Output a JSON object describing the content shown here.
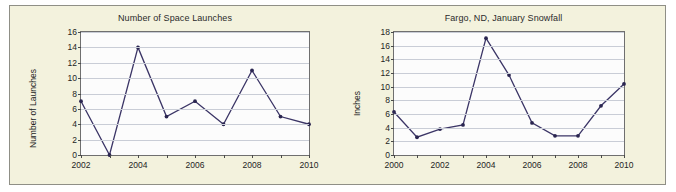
{
  "figure": {
    "background_color": "#f3f2dd",
    "border_color": "#8f8f86"
  },
  "style": {
    "line_color": "#3b3566",
    "marker_color": "#2a2550",
    "grid_color": "#c9cdd6",
    "plot_background": "#fcfcfc",
    "axis_color": "#6f6f6f"
  },
  "chart_data": [
    {
      "type": "line",
      "name": "space-launches",
      "title": "Number of Space Launches",
      "xlabel": "",
      "ylabel": "Number of Launches",
      "x": [
        2002,
        2003,
        2004,
        2005,
        2006,
        2007,
        2008,
        2009,
        2010
      ],
      "values": [
        7,
        0,
        14,
        5,
        7,
        4,
        11,
        5,
        4
      ],
      "xlim": [
        2002,
        2010
      ],
      "ylim": [
        0,
        16
      ],
      "yticks": [
        0,
        2,
        4,
        6,
        8,
        10,
        12,
        14,
        16
      ],
      "ytick_labels": [
        "0",
        "2",
        "4",
        "6",
        "8",
        "10",
        "12",
        "14",
        "16"
      ],
      "xticks": [
        2002,
        2003,
        2004,
        2005,
        2006,
        2007,
        2008,
        2009,
        2010
      ],
      "xtick_labels": [
        "2002",
        "",
        "2004",
        "",
        "2006",
        "",
        "2008",
        "",
        "2010"
      ],
      "grid": true,
      "legend": false
    },
    {
      "type": "line",
      "name": "fargo-snowfall",
      "title": "Fargo, ND, January Snowfall",
      "xlabel": "",
      "ylabel": "Inches",
      "x": [
        2000,
        2001,
        2002,
        2003,
        2004,
        2005,
        2006,
        2007,
        2008,
        2009,
        2010
      ],
      "values": [
        6.3,
        2.6,
        3.8,
        4.4,
        17.1,
        11.7,
        4.7,
        2.8,
        2.8,
        7.2,
        10.4
      ],
      "xlim": [
        2000,
        2010
      ],
      "ylim": [
        0,
        18
      ],
      "yticks": [
        0,
        2,
        4,
        6,
        8,
        10,
        12,
        14,
        16,
        18
      ],
      "ytick_labels": [
        "0",
        "2",
        "4",
        "6",
        "8",
        "10",
        "12",
        "14",
        "16",
        "18"
      ],
      "xticks": [
        2000,
        2001,
        2002,
        2003,
        2004,
        2005,
        2006,
        2007,
        2008,
        2009,
        2010
      ],
      "xtick_labels": [
        "2000",
        "",
        "2002",
        "",
        "2004",
        "",
        "2006",
        "",
        "2008",
        "",
        "2010"
      ],
      "grid": true,
      "legend": false
    }
  ]
}
